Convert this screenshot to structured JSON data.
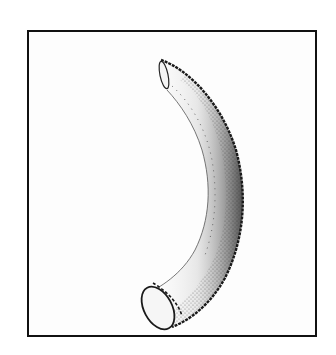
{
  "figure": {
    "style": "stippled pen-and-ink drawing",
    "frame": {
      "stroke_color": "#111111",
      "background": "#ffffff"
    },
    "ink_color": "#1a1a1a"
  }
}
